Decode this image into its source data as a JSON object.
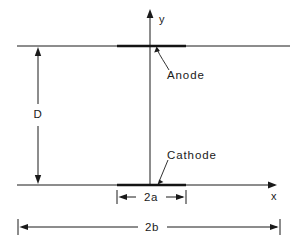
{
  "figure": {
    "type": "technical-schematic",
    "background_color": "#ffffff",
    "line_color": "#1a1a1a"
  },
  "axes": {
    "y_label": "y",
    "x_label": "x",
    "origin_x": 150,
    "origin_y": 185
  },
  "electrodes": [
    {
      "name": "anode",
      "label": "Anode",
      "y": 46,
      "x_start": 117,
      "x_end": 186
    },
    {
      "name": "cathode",
      "label": "Cathode",
      "y": 185,
      "x_start": 117,
      "x_end": 186
    }
  ],
  "dimensions": [
    {
      "name": "gap-spacing",
      "label": "D",
      "orientation": "vertical",
      "from_y": 46,
      "to_y": 185,
      "at_x": 38
    },
    {
      "name": "electrode-width",
      "label": "2a",
      "orientation": "horizontal",
      "from_x": 117,
      "to_x": 186,
      "at_y": 197
    },
    {
      "name": "boundary-width",
      "label": "2b",
      "orientation": "horizontal",
      "from_x": 18,
      "to_x": 280,
      "at_y": 227
    }
  ]
}
